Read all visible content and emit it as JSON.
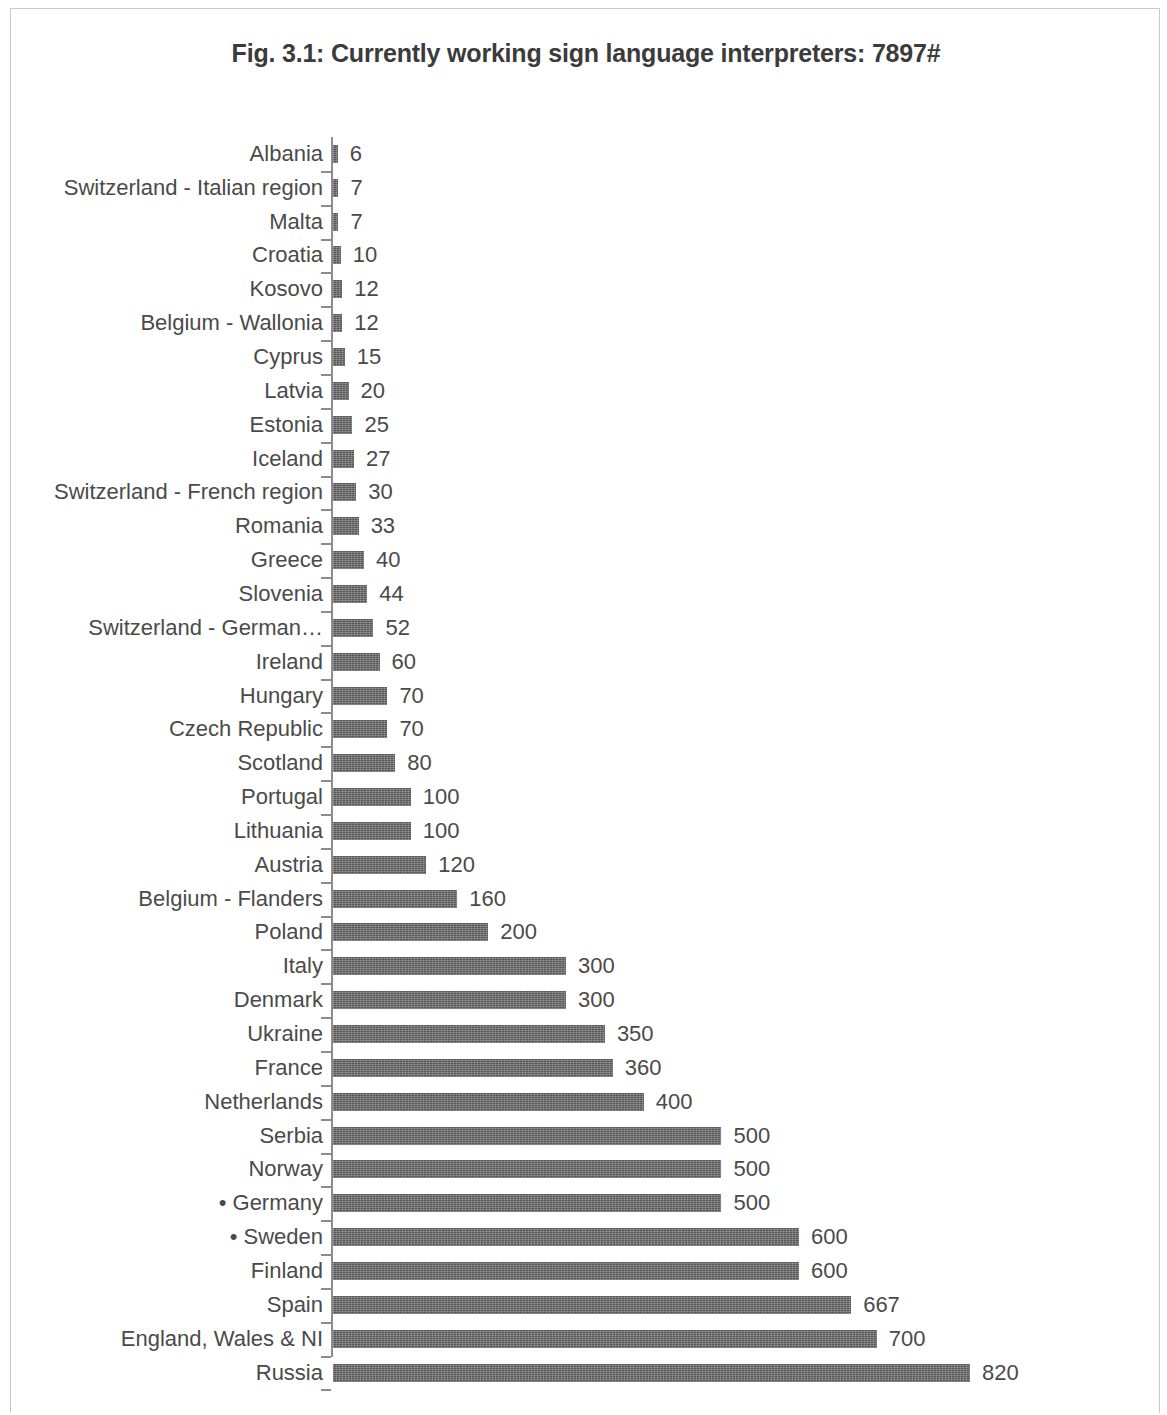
{
  "figure": {
    "title": "Fig. 3.1: Currently working sign language interpreters: 7897#"
  },
  "chart_data": {
    "type": "bar",
    "orientation": "horizontal",
    "title": "Fig. 3.1: Currently working sign language interpreters: 7897#",
    "xlabel": "",
    "ylabel": "",
    "grid": false,
    "legend": null,
    "axis_line": "vertical category axis on left with outward tick marks",
    "data_labels": true,
    "bar_color": "#6b6b6b",
    "text_color": "#4a4a4a",
    "total_annotation": "7897#",
    "xlim": [
      0,
      820
    ],
    "sort_order": "ascending by value",
    "categories": [
      "Albania",
      "Switzerland - Italian region",
      "Malta",
      "Croatia",
      "Kosovo",
      "Belgium - Wallonia",
      "Cyprus",
      "Latvia",
      "Estonia",
      "Iceland",
      "Switzerland - French region",
      "Romania",
      "Greece",
      "Slovenia",
      "Switzerland - German…",
      "Ireland",
      "Hungary",
      "Czech Republic",
      "Scotland",
      "Portugal",
      "Lithuania",
      "Austria",
      "Belgium - Flanders",
      "Poland",
      "Italy",
      "Denmark",
      "Ukraine",
      "France",
      "Netherlands",
      "Serbia",
      "Norway",
      "• Germany",
      "• Sweden",
      "Finland",
      "Spain",
      "England, Wales & NI",
      "Russia"
    ],
    "values": [
      6,
      7,
      7,
      10,
      12,
      12,
      15,
      20,
      25,
      27,
      30,
      33,
      40,
      44,
      52,
      60,
      70,
      70,
      80,
      100,
      100,
      120,
      160,
      200,
      300,
      300,
      350,
      360,
      400,
      500,
      500,
      500,
      600,
      600,
      667,
      700,
      820
    ],
    "value_labels": [
      "6",
      "7",
      "7",
      "10",
      "12",
      "12",
      "15",
      "20",
      "25",
      "27",
      "30",
      "33",
      "40",
      "44",
      "52",
      "60",
      "70",
      "70",
      "80",
      "100",
      "100",
      "120",
      "160",
      "200",
      "300",
      "300",
      "350",
      "360",
      "400",
      "500",
      "500",
      "500",
      "600",
      "600",
      "667",
      "700",
      "820"
    ]
  }
}
